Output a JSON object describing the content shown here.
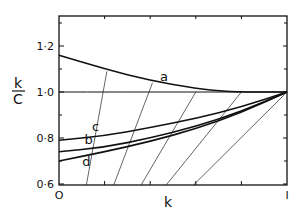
{
  "chart_data": {
    "type": "line",
    "title": "",
    "xlabel": "k",
    "ylabel": "k/C",
    "ylabel_num": "k",
    "ylabel_den": "C",
    "xlim": [
      0,
      1
    ],
    "ylim": [
      0.59,
      1.35
    ],
    "grid": false,
    "legend": "inline curve labels",
    "x_tick_labels": [
      {
        "value": 0,
        "label": "O"
      },
      {
        "value": 1,
        "label": "I"
      }
    ],
    "x_minor_ticks": [
      0.2,
      0.4,
      0.6,
      0.8
    ],
    "y_tick_labels": [
      {
        "value": 1.2,
        "label": "1·2"
      },
      {
        "value": 1.0,
        "label": "1·0"
      },
      {
        "value": 0.8,
        "label": "0·8"
      },
      {
        "value": 0.6,
        "label": "0·6"
      }
    ],
    "y_minor_ticks": [
      0.7,
      0.9,
      1.1,
      1.3
    ],
    "series": [
      {
        "name": "a",
        "x": [
          0,
          0.2,
          0.4,
          0.6,
          0.75,
          0.9,
          1.0
        ],
        "values": [
          1.16,
          1.1,
          1.05,
          1.015,
          1.0,
          1.0,
          1.0
        ]
      },
      {
        "name": "horizontal reference",
        "x": [
          0,
          1
        ],
        "values": [
          1.0,
          1.0
        ]
      },
      {
        "name": "c",
        "x": [
          0,
          0.2,
          0.4,
          0.6,
          0.8,
          1.0
        ],
        "values": [
          0.79,
          0.81,
          0.845,
          0.885,
          0.935,
          1.0
        ]
      },
      {
        "name": "b",
        "x": [
          0,
          0.2,
          0.4,
          0.6,
          0.8,
          1.0
        ],
        "values": [
          0.74,
          0.76,
          0.8,
          0.85,
          0.915,
          1.0
        ]
      },
      {
        "name": "d",
        "x": [
          0,
          0.2,
          0.4,
          0.6,
          0.8,
          1.0
        ],
        "values": [
          0.7,
          0.74,
          0.785,
          0.84,
          0.91,
          1.0
        ]
      }
    ],
    "thin_lines": [
      {
        "from": [
          0.21,
          1.09
        ],
        "to": [
          0.12,
          0.6
        ]
      },
      {
        "from": [
          0.41,
          1.04
        ],
        "to": [
          0.24,
          0.6
        ]
      },
      {
        "from": [
          0.6,
          1.0
        ],
        "to": [
          0.36,
          0.6
        ]
      },
      {
        "from": [
          0.8,
          1.0
        ],
        "to": [
          0.47,
          0.6
        ]
      },
      {
        "from": [
          0.99,
          0.99
        ],
        "to": [
          0.59,
          0.6
        ]
      }
    ],
    "curve_labels": [
      {
        "text": "a",
        "x": 0.46,
        "y": 1.05
      },
      {
        "text": "c",
        "x": 0.16,
        "y": 0.83
      },
      {
        "text": "b",
        "x": 0.13,
        "y": 0.775
      },
      {
        "text": "d",
        "x": 0.12,
        "y": 0.68
      }
    ]
  }
}
